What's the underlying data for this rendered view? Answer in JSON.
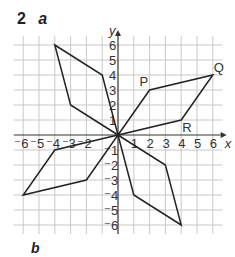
{
  "question": {
    "number": "2",
    "part_a": "a",
    "part_b": "b"
  },
  "axes": {
    "x_label": "x",
    "y_label": "y",
    "x_ticks": [
      "-6",
      "-5",
      "-4",
      "-3",
      "-2",
      "1",
      "2",
      "3",
      "4",
      "5",
      "6"
    ],
    "y_ticks": [
      "6",
      "5",
      "4",
      "3",
      "2",
      "1",
      "-1",
      "-2",
      "-3",
      "-4",
      "-5",
      "-6"
    ],
    "range": [
      -6,
      6
    ]
  },
  "points": {
    "P": {
      "label": "P",
      "x": 2,
      "y": 3
    },
    "Q": {
      "label": "Q",
      "x": 6,
      "y": 4
    },
    "R": {
      "label": "R",
      "x": 4,
      "y": 1
    }
  },
  "shapes": [
    {
      "name": "OPQR",
      "vertices": [
        [
          0,
          0
        ],
        [
          2,
          3
        ],
        [
          6,
          4
        ],
        [
          4,
          1
        ]
      ]
    },
    {
      "name": "upper-left",
      "vertices": [
        [
          0,
          0
        ],
        [
          -3,
          2
        ],
        [
          -4,
          6
        ],
        [
          -1,
          4
        ]
      ]
    },
    {
      "name": "lower-left",
      "vertices": [
        [
          0,
          0
        ],
        [
          -4,
          -1
        ],
        [
          -6,
          -4
        ],
        [
          -2,
          -3
        ]
      ]
    },
    {
      "name": "lower-right",
      "vertices": [
        [
          0,
          0
        ],
        [
          1,
          -4
        ],
        [
          4,
          -6
        ],
        [
          3,
          -2
        ]
      ]
    }
  ],
  "colors": {
    "grid": "#c8c8c8",
    "axis": "#333333",
    "shape": "#222222"
  }
}
